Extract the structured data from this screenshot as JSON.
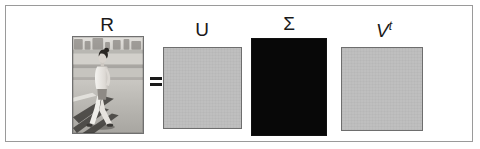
{
  "figure": {
    "background_color": "#ffffff",
    "frame_color": "#9a9a9a"
  },
  "equation": {
    "operator": "=",
    "operator_name": "equals-sign"
  },
  "matrices": [
    {
      "id": "R",
      "label": "R",
      "label_style": "upright",
      "kind": "image",
      "description": "grayscale photograph of a woman walking on a sunlit boardwalk casting long shadows",
      "fill_color": "#b9b9b9",
      "border_color": "#707070",
      "width_px": 72,
      "height_px": 98
    },
    {
      "id": "U",
      "label": "U",
      "label_style": "upright",
      "kind": "solid",
      "fill_color": "#bdbdbd",
      "border_color": "#6e6e6e",
      "width_px": 79,
      "height_px": 82
    },
    {
      "id": "Sigma",
      "label": "Σ",
      "label_style": "upright",
      "kind": "solid",
      "fill_color": "#080808",
      "border_color": "#111111",
      "width_px": 76,
      "height_px": 98
    },
    {
      "id": "Vt",
      "label": "V",
      "label_superscript": "t",
      "label_style": "italic",
      "kind": "solid",
      "fill_color": "#bdbdbd",
      "border_color": "#6e6e6e",
      "width_px": 82,
      "height_px": 84
    }
  ],
  "photo": {
    "sky_color": "#d9d7d2",
    "sand_color": "#c2c0bb",
    "ground_color": "#b0aea9",
    "shadow_color": "#3c3a38",
    "figure_light": "#efeeea",
    "figure_dark": "#55514d",
    "hair_color": "#2a2724"
  }
}
